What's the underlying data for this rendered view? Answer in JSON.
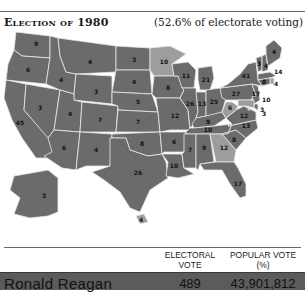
{
  "header": {
    "title": "Election of 1980",
    "subtitle": "(52.6% of electorate voting)"
  },
  "colors": {
    "reagan": "#6b6b6b",
    "carter": "#9d9d9d",
    "border": "#e8e8e8",
    "row_bg": "#5b5b5b"
  },
  "map": {
    "states": [
      {
        "abbr": "WA",
        "ev": "9",
        "winner": "reagan"
      },
      {
        "abbr": "OR",
        "ev": "6",
        "winner": "reagan"
      },
      {
        "abbr": "CA",
        "ev": "45",
        "winner": "reagan"
      },
      {
        "abbr": "NV",
        "ev": "3",
        "winner": "reagan"
      },
      {
        "abbr": "ID",
        "ev": "4",
        "winner": "reagan"
      },
      {
        "abbr": "MT",
        "ev": "4",
        "winner": "reagan"
      },
      {
        "abbr": "WY",
        "ev": "3",
        "winner": "reagan"
      },
      {
        "abbr": "UT",
        "ev": "4",
        "winner": "reagan"
      },
      {
        "abbr": "AZ",
        "ev": "6",
        "winner": "reagan"
      },
      {
        "abbr": "CO",
        "ev": "7",
        "winner": "reagan"
      },
      {
        "abbr": "NM",
        "ev": "4",
        "winner": "reagan"
      },
      {
        "abbr": "ND",
        "ev": "3",
        "winner": "reagan"
      },
      {
        "abbr": "SD",
        "ev": "4",
        "winner": "reagan"
      },
      {
        "abbr": "NE",
        "ev": "5",
        "winner": "reagan"
      },
      {
        "abbr": "KS",
        "ev": "7",
        "winner": "reagan"
      },
      {
        "abbr": "OK",
        "ev": "8",
        "winner": "reagan"
      },
      {
        "abbr": "TX",
        "ev": "26",
        "winner": "reagan"
      },
      {
        "abbr": "MN",
        "ev": "10",
        "winner": "carter"
      },
      {
        "abbr": "IA",
        "ev": "8",
        "winner": "reagan"
      },
      {
        "abbr": "MO",
        "ev": "12",
        "winner": "reagan"
      },
      {
        "abbr": "AR",
        "ev": "6",
        "winner": "reagan"
      },
      {
        "abbr": "LA",
        "ev": "10",
        "winner": "reagan"
      },
      {
        "abbr": "WI",
        "ev": "11",
        "winner": "reagan"
      },
      {
        "abbr": "IL",
        "ev": "26",
        "winner": "reagan"
      },
      {
        "abbr": "MI",
        "ev": "21",
        "winner": "reagan"
      },
      {
        "abbr": "IN",
        "ev": "13",
        "winner": "reagan"
      },
      {
        "abbr": "OH",
        "ev": "25",
        "winner": "reagan"
      },
      {
        "abbr": "KY",
        "ev": "9",
        "winner": "reagan"
      },
      {
        "abbr": "TN",
        "ev": "10",
        "winner": "reagan"
      },
      {
        "abbr": "MS",
        "ev": "7",
        "winner": "reagan"
      },
      {
        "abbr": "AL",
        "ev": "9",
        "winner": "reagan"
      },
      {
        "abbr": "GA",
        "ev": "12",
        "winner": "carter"
      },
      {
        "abbr": "FL",
        "ev": "17",
        "winner": "reagan"
      },
      {
        "abbr": "SC",
        "ev": "8",
        "winner": "reagan"
      },
      {
        "abbr": "NC",
        "ev": "13",
        "winner": "reagan"
      },
      {
        "abbr": "VA",
        "ev": "12",
        "winner": "reagan"
      },
      {
        "abbr": "WV",
        "ev": "6",
        "winner": "carter"
      },
      {
        "abbr": "PA",
        "ev": "27",
        "winner": "reagan"
      },
      {
        "abbr": "NY",
        "ev": "41",
        "winner": "reagan"
      },
      {
        "abbr": "VT",
        "ev": "3",
        "winner": "reagan"
      },
      {
        "abbr": "NH",
        "ev": "4",
        "winner": "reagan"
      },
      {
        "abbr": "ME",
        "ev": "4",
        "winner": "reagan"
      },
      {
        "abbr": "MA",
        "ev": "14",
        "winner": "reagan"
      },
      {
        "abbr": "RI",
        "ev": "4",
        "winner": "carter"
      },
      {
        "abbr": "CT",
        "ev": "8",
        "winner": "reagan"
      },
      {
        "abbr": "NJ",
        "ev": "17",
        "winner": "reagan"
      },
      {
        "abbr": "DE",
        "ev": "3",
        "winner": "reagan"
      },
      {
        "abbr": "MD",
        "ev": "10",
        "winner": "carter"
      },
      {
        "abbr": "DC",
        "ev": "3",
        "winner": "carter"
      },
      {
        "abbr": "AK",
        "ev": "3",
        "winner": "reagan"
      },
      {
        "abbr": "HI",
        "ev": "4",
        "winner": "carter"
      }
    ]
  },
  "table": {
    "columns": [
      {
        "label_line1": "ELECTORAL",
        "label_line2": "VOTE"
      },
      {
        "label_line1": "POPULAR VOTE",
        "label_line2": "(%)"
      }
    ],
    "rows": [
      {
        "candidate": "Ronald Reagan",
        "electoral": "489",
        "popular": "43,901,812"
      }
    ]
  }
}
